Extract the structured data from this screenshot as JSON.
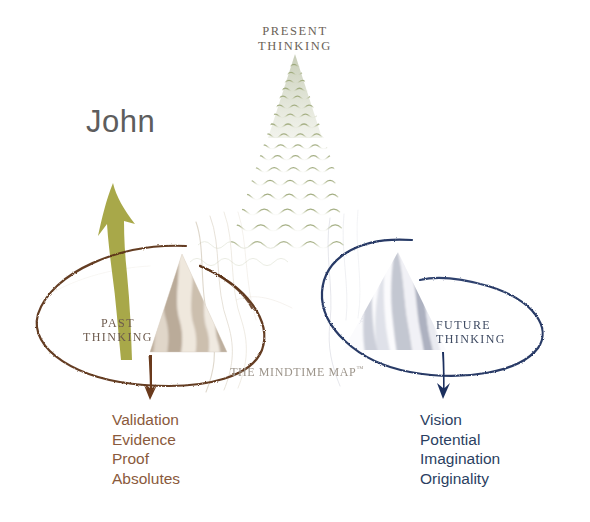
{
  "diagram": {
    "title_caption": "THE MINDTIME MAP",
    "caption_tm": "™",
    "person_label": "John",
    "colors": {
      "past_accent": "#5c3317",
      "past_text": "#8a5a3c",
      "future_accent": "#1b2f5e",
      "future_text": "#2b3f62",
      "present_accent": "#a8b184",
      "arrow_person": "#a3a33f",
      "label_gray": "#5d5d5d"
    },
    "zones": {
      "present": {
        "label": "PRESENT\nTHINKING",
        "shape": "wavy-green-triangle"
      },
      "past": {
        "label": "PAST\nTHINKING",
        "shape": "banded-tan-triangle",
        "loop": "brown-hand-drawn-ellipse",
        "arrow": "down-arrow",
        "words": [
          "Validation",
          "Evidence",
          "Proof",
          "Absolutes"
        ]
      },
      "future": {
        "label": "FUTURE\nTHINKING",
        "shape": "banded-gray-triangle",
        "loop": "navy-hand-drawn-ellipse",
        "arrow": "down-arrow",
        "words": [
          "Vision",
          "Potential",
          "Imagination",
          "Originality"
        ]
      }
    }
  }
}
